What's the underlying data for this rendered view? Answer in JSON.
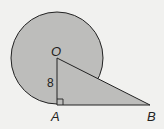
{
  "diagram": {
    "points": {
      "O": {
        "label": "O",
        "x": 57,
        "y": 58
      },
      "A": {
        "label": "A",
        "x": 57,
        "y": 105
      },
      "B": {
        "label": "B",
        "x": 150,
        "y": 105
      }
    },
    "circle": {
      "center": "O",
      "radius": 46
    },
    "segments": [
      {
        "from": "O",
        "to": "A",
        "label": "8"
      },
      {
        "from": "O",
        "to": "B",
        "label": ""
      },
      {
        "from": "A",
        "to": "B",
        "label": ""
      }
    ],
    "right_angle_at": "A",
    "side_label_OA": "8",
    "colors": {
      "fill": "#bdbdbb",
      "stroke": "#222222",
      "background": "#f1f1ef"
    }
  }
}
